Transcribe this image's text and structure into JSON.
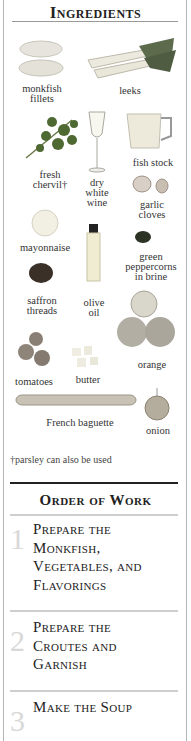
{
  "ingredients": {
    "title": "Ingredients",
    "items": [
      {
        "label": "monkfish fillets",
        "l1": "monkfish",
        "l2": "fillets",
        "icon": "monkfish-image"
      },
      {
        "label": "leeks",
        "icon": "leeks-image"
      },
      {
        "label": "fresh chervil†",
        "l1": "fresh",
        "l2": "chervil†",
        "icon": "chervil-image"
      },
      {
        "label": "dry white wine",
        "l1": "dry",
        "l2": "white",
        "l3": "wine",
        "icon": "wine-glass-image"
      },
      {
        "label": "fish stock",
        "icon": "fish-stock-jug-image"
      },
      {
        "label": "garlic cloves",
        "l1": "garlic",
        "l2": "cloves",
        "icon": "garlic-image"
      },
      {
        "label": "mayonnaise",
        "icon": "mayonnaise-image"
      },
      {
        "label": "olive oil",
        "l1": "olive",
        "l2": "oil",
        "icon": "olive-oil-bottle-image"
      },
      {
        "label": "green peppercorns in brine",
        "l1": "green",
        "l2": "peppercorns",
        "l3": "in brine",
        "icon": "peppercorns-image"
      },
      {
        "label": "saffron threads",
        "l1": "saffron",
        "l2": "threads",
        "icon": "saffron-image"
      },
      {
        "label": "orange",
        "icon": "orange-image"
      },
      {
        "label": "tomatoes",
        "icon": "tomatoes-image"
      },
      {
        "label": "butter",
        "icon": "butter-image"
      },
      {
        "label": "French baguette",
        "icon": "baguette-image"
      },
      {
        "label": "onion",
        "icon": "onion-image"
      }
    ],
    "footnote": "†parsley can also be used"
  },
  "order_of_work": {
    "title": "Order of Work",
    "steps": [
      {
        "number": "1",
        "l1": "Prepare the",
        "l2": "Monkfish,",
        "l3": "Vegetables, and",
        "l4": "Flavorings"
      },
      {
        "number": "2",
        "l1": "Prepare the",
        "l2": "Croutes and",
        "l3": "Garnish"
      },
      {
        "number": "3",
        "l1": "Make the Soup"
      }
    ]
  }
}
